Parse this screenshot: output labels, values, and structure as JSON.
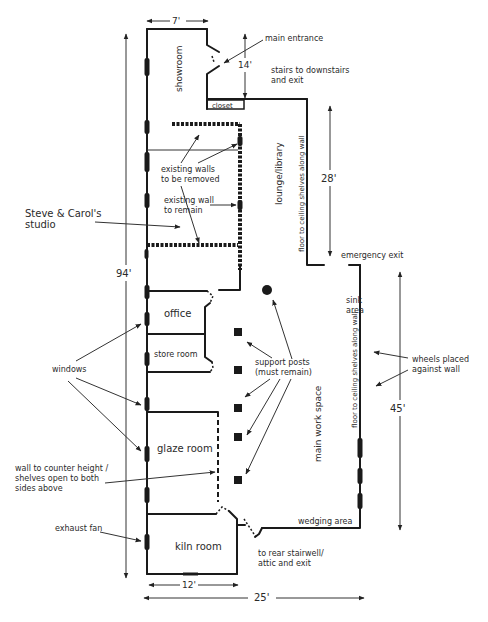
{
  "diagram": {
    "type": "floor-plan",
    "dimensions": {
      "top_width": "7'",
      "entrance_depth": "14'",
      "lounge_length": "28'",
      "overall_length": "94'",
      "work_space_length": "45'",
      "kiln_room_width": "12'",
      "overall_width": "25'"
    },
    "rooms": {
      "showroom": "showroom",
      "closet": "closet",
      "lounge": "lounge/library",
      "office": "office",
      "store_room": "store room",
      "glaze_room": "glaze room",
      "kiln_room": "kiln room",
      "main_work_space": "main work space",
      "sink_area_line1": "sink",
      "sink_area_line2": "area",
      "wedging_area": "wedging area"
    },
    "wall_notes": {
      "lounge_shelves": "floor to ceiling shelves along wall",
      "work_shelves": "floor to ceiling shelves along wall"
    },
    "annotations": {
      "main_entrance": "main entrance",
      "stairs_line1": "stairs to downstairs",
      "stairs_line2": "and exit",
      "walls_removed_line1": "existing walls",
      "walls_removed_line2": "to be removed",
      "wall_remain_line1": "existing wall",
      "wall_remain_line2": "to remain",
      "studio_line1": "Steve & Carol's",
      "studio_line2": "studio",
      "emergency_exit": "emergency exit",
      "support_posts_line1": "support posts",
      "support_posts_line2": "(must remain)",
      "wheels_line1": "wheels placed",
      "wheels_line2": "against wall",
      "windows": "windows",
      "counter_wall_line1": "wall to counter height /",
      "counter_wall_line2": "shelves open to both",
      "counter_wall_line3": "sides above",
      "exhaust_fan": "exhaust fan",
      "rear_stair_line1": "to rear stairwell/",
      "rear_stair_line2": "attic and exit"
    }
  }
}
